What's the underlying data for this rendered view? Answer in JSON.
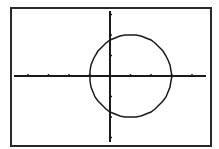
{
  "chart_data": {
    "type": "line",
    "title": "",
    "xlabel": "",
    "ylabel": "",
    "xlim": [
      -4,
      4.8
    ],
    "ylim": [
      -3.4,
      3.4
    ],
    "x_ticks": [
      -4,
      -3,
      -2,
      -1,
      1,
      2,
      3,
      4
    ],
    "y_ticks": [
      -3,
      -2,
      -1,
      1,
      2,
      3
    ],
    "grid": false,
    "series": [
      {
        "name": "circle",
        "shape": "circle",
        "center": [
          1,
          0
        ],
        "radius": 2
      }
    ]
  },
  "colors": {
    "line": "#1a1a1a",
    "background": "#ffffff",
    "frame": "#2a2a2a"
  }
}
